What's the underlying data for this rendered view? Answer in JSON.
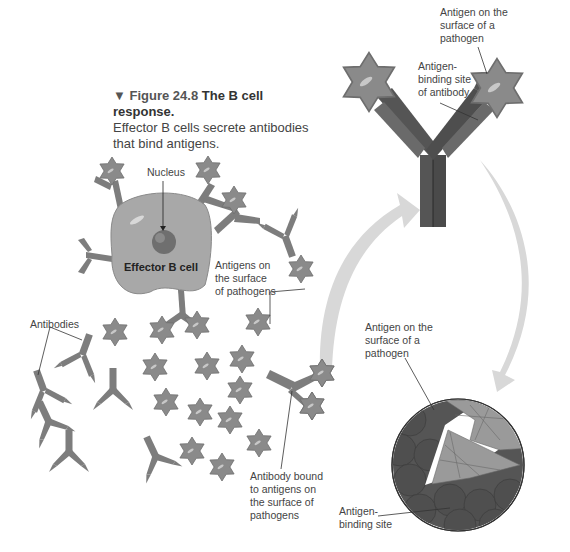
{
  "caption": {
    "marker": "▼",
    "figure_number": "Figure 24.8",
    "title": "The B cell response.",
    "body": "Effector B cells secrete antibodies that bind antigens."
  },
  "labels": {
    "nucleus": "Nucleus",
    "effector_b_cell": "Effector B cell",
    "antigens_surface_pathogens": "Antigens on\nthe surface\nof pathogens",
    "antibodies": "Antibodies",
    "antibody_bound": "Antibody bound\nto antigens on\nthe surface of\npathogens",
    "top_antigen": "Antigen on the\nsurface of a\npathogen",
    "top_binding_site": "Antigen-\nbinding site\nof antibody",
    "zoom_antigen": "Antigen on the\nsurface of a\npathogen",
    "zoom_binding_site": "Antigen-\nbinding site"
  },
  "colors": {
    "antigen_star": "#8a8a8a",
    "antibody_small": "#7d7d7d",
    "antibody_large_dark": "#4e4e4e",
    "antibody_large_light": "#6a6a6a",
    "b_cell": "#a8a8a8",
    "nucleus": "#6f6f6f",
    "flow_arrow": "#d6d6d6",
    "zoom_circle_dark": "#555555",
    "zoom_circle_light": "#9a9a9a"
  }
}
